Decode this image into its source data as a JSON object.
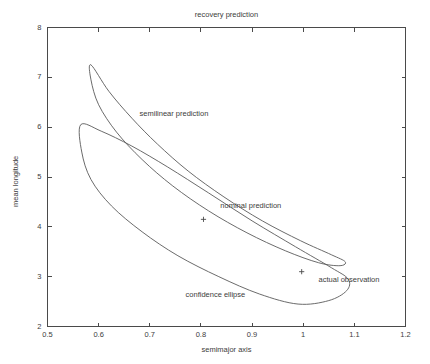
{
  "chart_data": {
    "type": "line",
    "title": "recovery prediction",
    "xlabel": "semimajor axis",
    "ylabel": "mean longitude",
    "xlim": [
      0.5,
      1.2
    ],
    "ylim": [
      2,
      8
    ],
    "xticks": [
      "0.5",
      "0.6",
      "0.7",
      "0.8",
      "0.9",
      "1",
      "1.1",
      "1.2"
    ],
    "xtick_values": [
      0.5,
      0.6,
      0.7,
      0.8,
      0.9,
      1.0,
      1.1,
      1.2
    ],
    "yticks": [
      "2",
      "3",
      "4",
      "5",
      "6",
      "7",
      "8"
    ],
    "ytick_values": [
      2,
      3,
      4,
      5,
      6,
      7,
      8
    ],
    "grid": false,
    "legend": "none",
    "series": [
      {
        "name": "semilinear prediction",
        "kind": "closed-curve",
        "description": "elongated banana-shaped closed curve from upper-left tip near (0.58, 7.25) sweeping down to the right tip near (1.08, 3.3)",
        "points": [
          [
            0.585,
            7.25
          ],
          [
            0.62,
            6.72
          ],
          [
            0.665,
            6.18
          ],
          [
            0.715,
            5.66
          ],
          [
            0.775,
            5.12
          ],
          [
            0.845,
            4.6
          ],
          [
            0.92,
            4.12
          ],
          [
            0.995,
            3.72
          ],
          [
            1.055,
            3.44
          ],
          [
            1.082,
            3.3
          ],
          [
            1.072,
            3.22
          ],
          [
            1.03,
            3.28
          ],
          [
            0.965,
            3.52
          ],
          [
            0.89,
            3.88
          ],
          [
            0.815,
            4.32
          ],
          [
            0.745,
            4.82
          ],
          [
            0.685,
            5.35
          ],
          [
            0.635,
            5.9
          ],
          [
            0.6,
            6.45
          ],
          [
            0.585,
            6.95
          ],
          [
            0.585,
            7.25
          ]
        ]
      },
      {
        "name": "confidence ellipse",
        "kind": "closed-curve",
        "description": "elongated banana-shaped closed curve from left tip near (0.565, 6.05) sweeping down to right tip near (1.085, 2.33)",
        "points": [
          [
            0.565,
            6.05
          ],
          [
            0.605,
            5.92
          ],
          [
            0.665,
            5.62
          ],
          [
            0.735,
            5.2
          ],
          [
            0.815,
            4.68
          ],
          [
            0.9,
            4.12
          ],
          [
            0.985,
            3.6
          ],
          [
            1.055,
            3.18
          ],
          [
            1.088,
            2.95
          ],
          [
            1.085,
            2.72
          ],
          [
            1.05,
            2.52
          ],
          [
            0.99,
            2.45
          ],
          [
            0.915,
            2.65
          ],
          [
            0.835,
            3.0
          ],
          [
            0.755,
            3.42
          ],
          [
            0.685,
            3.9
          ],
          [
            0.625,
            4.42
          ],
          [
            0.585,
            4.95
          ],
          [
            0.567,
            5.5
          ],
          [
            0.565,
            6.05
          ]
        ]
      }
    ],
    "markers": [
      {
        "name": "nominal prediction",
        "x": 0.805,
        "y": 4.15,
        "symbol": "+"
      },
      {
        "name": "actual observation",
        "x": 0.997,
        "y": 3.1,
        "symbol": "+"
      }
    ],
    "annotations": [
      {
        "name": "semilinear-prediction-label",
        "text": "semilinear prediction",
        "x": 0.68,
        "y": 6.27
      },
      {
        "name": "nominal-prediction-label",
        "text": "nominal prediction",
        "x": 0.838,
        "y": 4.42
      },
      {
        "name": "actual-observation-label",
        "text": "actual observation",
        "x": 1.03,
        "y": 2.93
      },
      {
        "name": "confidence-ellipse-label",
        "text": "confidence ellipse",
        "x": 0.77,
        "y": 2.63
      }
    ],
    "colors": {
      "curve": "#5a5a5a",
      "axis": "#4a4a4a",
      "text": "#3c3c3c",
      "background": "#ffffff"
    }
  }
}
